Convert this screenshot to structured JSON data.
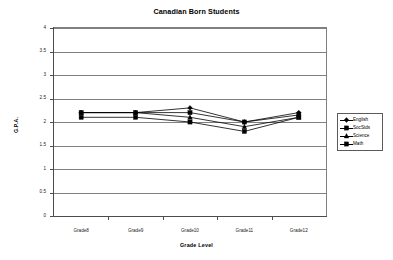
{
  "chart_data": {
    "type": "line",
    "title": "Canadian Born Students",
    "xlabel": "Grade Level",
    "ylabel": "G.P.A.",
    "categories": [
      "Grade8",
      "Grade9",
      "Grade10",
      "Grade11",
      "Grade12"
    ],
    "ylim": [
      0,
      4
    ],
    "yticks": [
      "0",
      "0.5",
      "1",
      "1.5",
      "2",
      "2.5",
      "3",
      "3.5",
      "4"
    ],
    "grid": "horizontal",
    "legend_position": "right",
    "series": [
      {
        "name": "English",
        "marker": "diamond",
        "values": [
          2.2,
          2.2,
          2.3,
          2.0,
          2.2
        ]
      },
      {
        "name": "SocStds",
        "marker": "square",
        "values": [
          2.2,
          2.2,
          2.2,
          2.0,
          2.15
        ]
      },
      {
        "name": "Science",
        "marker": "triangle",
        "values": [
          2.2,
          2.2,
          2.1,
          1.9,
          2.1
        ]
      },
      {
        "name": "Math",
        "marker": "square",
        "values": [
          2.1,
          2.1,
          2.0,
          1.8,
          2.1
        ]
      }
    ]
  },
  "legend": {
    "items": [
      {
        "label": "English"
      },
      {
        "label": "SocStds"
      },
      {
        "label": "Science"
      },
      {
        "label": "Math"
      }
    ]
  }
}
